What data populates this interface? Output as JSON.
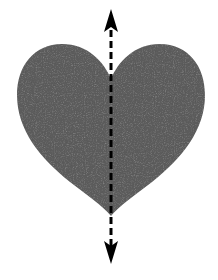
{
  "diagram": {
    "type": "symmetry-line-illustration",
    "shape": {
      "name": "heart",
      "fill_color": "#5c5c5c",
      "has_texture": true
    },
    "symmetry_line": {
      "orientation": "vertical",
      "style": "dashed",
      "color": "#000000",
      "arrowheads": [
        "top",
        "bottom"
      ]
    },
    "background_color": "#ffffff"
  }
}
